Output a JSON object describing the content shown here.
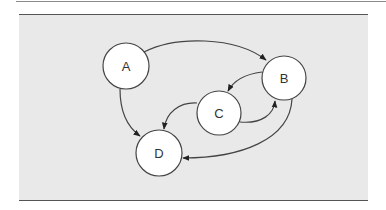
{
  "diagram": {
    "type": "directed-graph",
    "colors": {
      "panel_background": "#e9e9e9",
      "node_fill": "#ffffff",
      "stroke": "#444444"
    },
    "nodes": [
      {
        "id": "A",
        "label": "A",
        "cx": 126,
        "cy": 66,
        "r": 23
      },
      {
        "id": "B",
        "label": "B",
        "cx": 284,
        "cy": 78,
        "r": 22
      },
      {
        "id": "C",
        "label": "C",
        "cx": 219,
        "cy": 113,
        "r": 22
      },
      {
        "id": "D",
        "label": "D",
        "cx": 159,
        "cy": 153,
        "r": 23
      }
    ],
    "edges": [
      {
        "from": "A",
        "to": "B"
      },
      {
        "from": "A",
        "to": "D"
      },
      {
        "from": "B",
        "to": "C"
      },
      {
        "from": "C",
        "to": "B"
      },
      {
        "from": "C",
        "to": "D"
      },
      {
        "from": "B",
        "to": "D"
      }
    ]
  }
}
